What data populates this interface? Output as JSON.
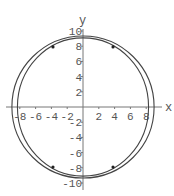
{
  "chart_data": {
    "type": "line",
    "title": "",
    "xlabel": "x",
    "ylabel": "y",
    "xlim": [
      -10,
      10
    ],
    "ylim": [
      -10,
      10
    ],
    "grid": false,
    "legend": null,
    "x_ticks": [
      -8,
      -6,
      -4,
      -2,
      2,
      4,
      6,
      8
    ],
    "y_ticks": [
      -10,
      -8,
      -6,
      -4,
      -2,
      2,
      4,
      6,
      8,
      10
    ],
    "x_tick_labels": [
      "-8",
      "-6",
      "-4",
      "-2",
      "2",
      "4",
      "6",
      "8"
    ],
    "y_tick_labels": [
      "-10",
      "-8",
      "-6",
      "-4",
      "-2",
      "2",
      "4",
      "6",
      "8",
      "10"
    ],
    "series": [
      {
        "name": "outer-curve",
        "shape": "ellipse",
        "center": [
          0,
          0
        ],
        "rx": 9.0,
        "ry": 9.35,
        "color": "#444444"
      },
      {
        "name": "inner-curve",
        "shape": "ellipse",
        "center": [
          0,
          0
        ],
        "rx": 8.3,
        "ry": 9.1,
        "color": "#444444"
      }
    ],
    "points": [
      {
        "x": -3.8,
        "y": 7.9
      },
      {
        "x": 3.8,
        "y": 7.9
      },
      {
        "x": -3.8,
        "y": -7.9
      },
      {
        "x": 3.8,
        "y": -7.9
      }
    ]
  },
  "layout": {
    "origin_px": [
      83,
      107
    ],
    "px_per_unit_x": 7.9,
    "px_per_unit_y": 7.6
  }
}
